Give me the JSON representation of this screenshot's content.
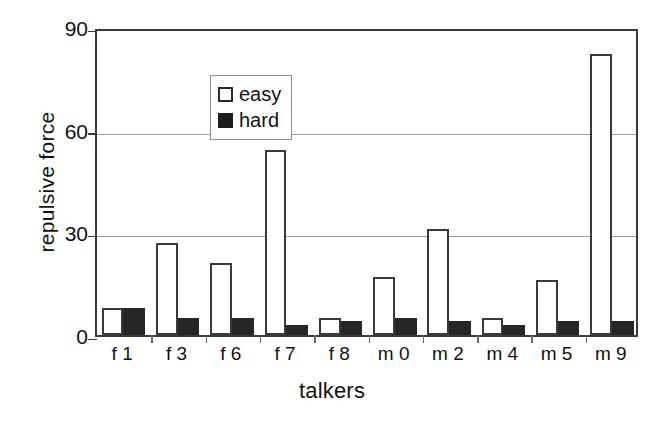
{
  "chart_data": {
    "type": "bar",
    "title": "",
    "subtitle": "",
    "xlabel": "talkers",
    "ylabel": "repulsive force",
    "categories": [
      "f 1",
      "f 3",
      "f 6",
      "f 7",
      "f 8",
      "m 0",
      "m 2",
      "m 4",
      "m 5",
      "m 9"
    ],
    "series": [
      {
        "name": "easy",
        "color": "#ffffff",
        "values": [
          8,
          27,
          21,
          54,
          5,
          17,
          31,
          5,
          16,
          82
        ]
      },
      {
        "name": "hard",
        "color": "#262626",
        "values": [
          8,
          5,
          5,
          3,
          4,
          5,
          4,
          3,
          4,
          4
        ]
      }
    ],
    "ylim": [
      0,
      90
    ],
    "yticks": [
      0,
      30,
      60,
      90
    ],
    "ytick_labels": [
      "0",
      "30",
      "60",
      "90"
    ],
    "grid": "horizontal",
    "legend_position": "top-left",
    "legend_entries": [
      "easy",
      "hard"
    ]
  },
  "axes": {
    "y_title": "repulsive force",
    "x_title": "talkers"
  }
}
